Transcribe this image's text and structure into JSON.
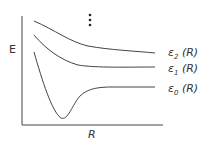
{
  "diagram": {
    "y_axis_label": "E",
    "x_axis_label": "R",
    "ellipsis": "⋮",
    "curves": [
      {
        "id": "eps2",
        "symbol": "ε",
        "subscript": "2",
        "arg": "(R)"
      },
      {
        "id": "eps1",
        "symbol": "ε",
        "subscript": "1",
        "arg": "(R)"
      },
      {
        "id": "eps0",
        "symbol": "ε",
        "subscript": "0",
        "arg": "(R)"
      }
    ],
    "line_color": "#444444"
  }
}
